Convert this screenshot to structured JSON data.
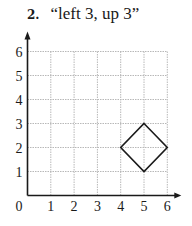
{
  "problem": {
    "number": "2.",
    "instruction": "“left 3, up 3”"
  },
  "chart_data": {
    "type": "scatter",
    "xlabel": "",
    "ylabel": "",
    "xlim": [
      0,
      6
    ],
    "ylim": [
      0,
      6
    ],
    "grid": true,
    "x_ticks": [
      "0",
      "1",
      "2",
      "3",
      "4",
      "5",
      "6"
    ],
    "y_ticks": [
      "1",
      "2",
      "3",
      "4",
      "5",
      "6"
    ],
    "shapes": [
      {
        "name": "diamond",
        "type": "polygon",
        "points": [
          [
            5,
            3
          ],
          [
            6,
            2
          ],
          [
            5,
            1
          ],
          [
            4,
            2
          ]
        ]
      }
    ]
  },
  "colors": {
    "axis": "#1a1a1a",
    "grid": "#b8b8b8",
    "shape": "#1a1a1a"
  }
}
